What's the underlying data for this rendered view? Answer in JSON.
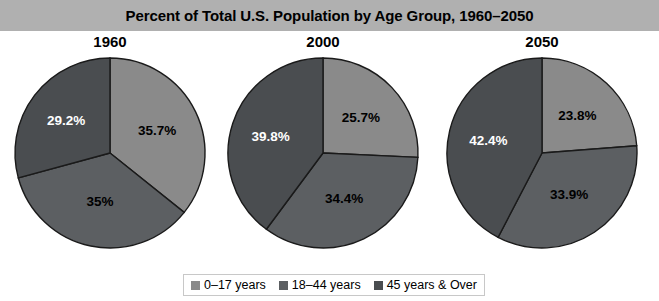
{
  "title": "Percent of Total U.S. Population by Age Group, 1960–2050",
  "colors": {
    "title_bar_bg": "#b0b0b0",
    "light_grey": "#8a8a8a",
    "medium_grey": "#5c5f62",
    "dark_grey": "#4a4d50",
    "slice_border": "#1a1a1a",
    "legend_border": "#c8c8c8",
    "page_bg": "#ffffff"
  },
  "legend": {
    "items": [
      {
        "label": "0–17 years",
        "color": "#8a8a8a"
      },
      {
        "label": "18–44 years",
        "color": "#5c5f62"
      },
      {
        "label": "45 years & Over",
        "color": "#4a4d50"
      }
    ]
  },
  "charts": [
    {
      "year": "1960",
      "labels": [
        "35.7%",
        "35%",
        "29.2%"
      ]
    },
    {
      "year": "2000",
      "labels": [
        "25.7%",
        "34.4%",
        "39.8%"
      ]
    },
    {
      "year": "2050",
      "labels": [
        "23.8%",
        "33.9%",
        "42.4%"
      ]
    }
  ],
  "chart_data": {
    "type": "pie",
    "title": "Percent of Total U.S. Population by Age Group, 1960–2050",
    "xlabel": "",
    "ylabel": "",
    "legend_position": "bottom-center",
    "grid": false,
    "categories": [
      "0–17 years",
      "18–44 years",
      "45 years & Over"
    ],
    "panels": [
      {
        "name": "1960",
        "values": [
          35.7,
          35.0,
          29.2
        ],
        "labels": [
          "35.7%",
          "35%",
          "29.2%"
        ]
      },
      {
        "name": "2000",
        "values": [
          25.7,
          34.4,
          39.8
        ],
        "labels": [
          "25.7%",
          "34.4%",
          "39.8%"
        ]
      },
      {
        "name": "2050",
        "values": [
          23.8,
          33.9,
          42.4
        ],
        "labels": [
          "23.8%",
          "33.9%",
          "42.4%"
        ]
      }
    ]
  }
}
